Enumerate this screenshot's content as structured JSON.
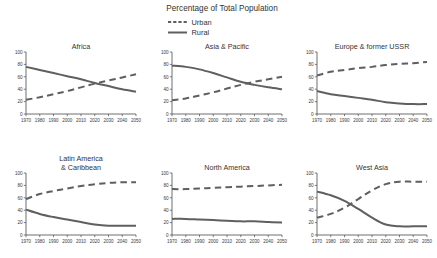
{
  "chart_data": {
    "type": "line",
    "title": "Percentage of Total Population",
    "xlabel": "",
    "ylabel": "",
    "xlim": [
      1970,
      2050
    ],
    "ylim": [
      0,
      100
    ],
    "grid": false,
    "legend_position": "top-center",
    "x": [
      1970,
      1980,
      1990,
      2000,
      2010,
      2020,
      2030,
      2040,
      2050
    ],
    "xticklabels": [
      "1970",
      "1980",
      "1990",
      "2000",
      "2010",
      "2020",
      "2030",
      "2040",
      "2050"
    ],
    "yticks": [
      0,
      20,
      40,
      60,
      80,
      100
    ],
    "yticklabels": [
      "0",
      "20",
      "40",
      "60",
      "80",
      "100"
    ],
    "legend": [
      {
        "name": "Urban",
        "style": "dashed"
      },
      {
        "name": "Rural",
        "style": "solid"
      }
    ],
    "panels": [
      {
        "title": "Africa",
        "title_lines": [
          "Africa"
        ],
        "series": [
          {
            "name": "Urban",
            "style": "dashed",
            "values": [
              23,
              27,
              32,
              37,
              43,
              49,
              54,
              59,
              64
            ]
          },
          {
            "name": "Rural",
            "style": "solid",
            "values": [
              76,
              71,
              66,
              61,
              56,
              50,
              45,
              40,
              36
            ]
          }
        ]
      },
      {
        "title": "Asia & Pacific",
        "title_lines": [
          "Asia & Pacific"
        ],
        "series": [
          {
            "name": "Urban",
            "style": "dashed",
            "values": [
              22,
              25,
              30,
              35,
              41,
              47,
              52,
              56,
              60
            ]
          },
          {
            "name": "Rural",
            "style": "solid",
            "values": [
              78,
              76,
              72,
              66,
              59,
              52,
              47,
              43,
              40
            ]
          }
        ]
      },
      {
        "title": "Europe & former USSR",
        "title_lines": [
          "Europe & former USSR"
        ],
        "series": [
          {
            "name": "Urban",
            "style": "dashed",
            "values": [
              62,
              68,
              71,
              74,
              76,
              79,
              81,
              82,
              84
            ]
          },
          {
            "name": "Rural",
            "style": "solid",
            "values": [
              37,
              32,
              29,
              26,
              23,
              19,
              17,
              16,
              16
            ]
          }
        ]
      },
      {
        "title": "Latin America & Caribbean",
        "title_lines": [
          "Latin America",
          "& Caribbean"
        ],
        "series": [
          {
            "name": "Urban",
            "style": "dashed",
            "values": [
              58,
              66,
              71,
              75,
              79,
              82,
              84,
              85,
              85
            ]
          },
          {
            "name": "Rural",
            "style": "solid",
            "values": [
              41,
              34,
              29,
              25,
              21,
              17,
              15,
              15,
              15
            ]
          }
        ]
      },
      {
        "title": "North America",
        "title_lines": [
          "North America"
        ],
        "series": [
          {
            "name": "Urban",
            "style": "dashed",
            "values": [
              74,
              74,
              75,
              76,
              77,
              78,
              79,
              80,
              81
            ]
          },
          {
            "name": "Rural",
            "style": "solid",
            "values": [
              26,
              26,
              25,
              24,
              23,
              22,
              22,
              21,
              20
            ]
          }
        ]
      },
      {
        "title": "West Asia",
        "title_lines": [
          "West Asia"
        ],
        "series": [
          {
            "name": "Urban",
            "style": "dashed",
            "values": [
              28,
              34,
              44,
              58,
              72,
              82,
              86,
              86,
              86
            ]
          },
          {
            "name": "Rural",
            "style": "solid",
            "values": [
              70,
              64,
              55,
              42,
              28,
              17,
              14,
              14,
              14
            ]
          }
        ]
      }
    ]
  }
}
